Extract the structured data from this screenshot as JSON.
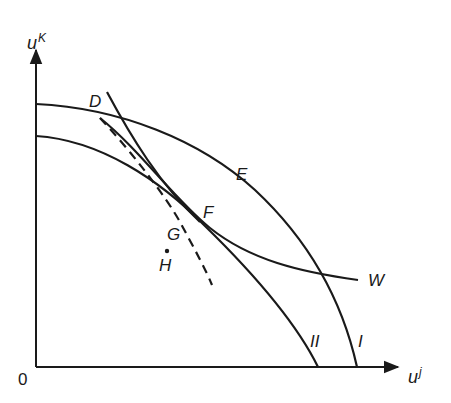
{
  "diagram": {
    "axes": {
      "y_label": "u",
      "y_superscript": "K",
      "x_label": "u",
      "x_superscript": "j",
      "origin": "0"
    },
    "curves": {
      "frontier_outer": "I",
      "frontier_inner": "II",
      "welfare_contour": "W"
    },
    "points": {
      "D": "D",
      "E": "E",
      "F": "F",
      "G": "G",
      "H": "H"
    },
    "colors": {
      "ink": "#1a1a1a",
      "background": "#ffffff"
    }
  }
}
